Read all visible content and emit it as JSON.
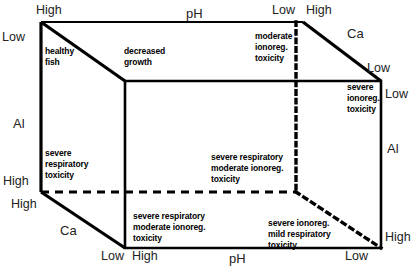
{
  "diagram": {
    "type": "3d-cube-conceptual",
    "stroke_color": "#000000",
    "background_color": "#ffffff",
    "variables": {
      "ph": "pH",
      "al": "Al",
      "ca": "Ca"
    },
    "axis_labels": {
      "top_back_left_high": "High",
      "top_left_low": "Low",
      "top_ph": "pH",
      "top_back_right_low": "Low",
      "top_front_right_high": "High",
      "right_ca_low": "Low",
      "right_low": "Low",
      "right_al": "Al",
      "right_high": "High",
      "left_al": "Al",
      "left_high_upper": "High",
      "left_high_lower": "High",
      "left_ca": "Ca",
      "top_right_ca": "Ca",
      "bottom_back_low": "Low",
      "bottom_front_high": "High",
      "bottom_ph": "pH",
      "bottom_front_low": "Low"
    },
    "regions": [
      {
        "id": "healthy-fish",
        "lines": [
          "healthy",
          "fish"
        ]
      },
      {
        "id": "decreased-growth",
        "lines": [
          "decreased",
          "growth"
        ]
      },
      {
        "id": "moderate-ionoreg-toxicity",
        "lines": [
          "moderate",
          "ionoreg.",
          "toxicity"
        ]
      },
      {
        "id": "severe-ionoreg-toxicity",
        "lines": [
          "severe",
          "ionoreg.",
          "toxicity"
        ]
      },
      {
        "id": "severe-respiratory-toxicity",
        "lines": [
          "severe",
          "respiratory",
          "toxicity"
        ]
      },
      {
        "id": "severe-respiratory-moderate-ionoreg-toxicity-mid",
        "lines": [
          "severe respiratory",
          "moderate ionoreg.",
          "toxicity"
        ]
      },
      {
        "id": "severe-respiratory-moderate-ionoreg-toxicity-front",
        "lines": [
          "severe respiratory",
          "moderate ionoreg.",
          "toxicity"
        ]
      },
      {
        "id": "severe-ionoreg-mild-respiratory-toxicity",
        "lines": [
          "severe ionoreg.",
          "mild  respiratory",
          "toxicity"
        ]
      }
    ]
  }
}
